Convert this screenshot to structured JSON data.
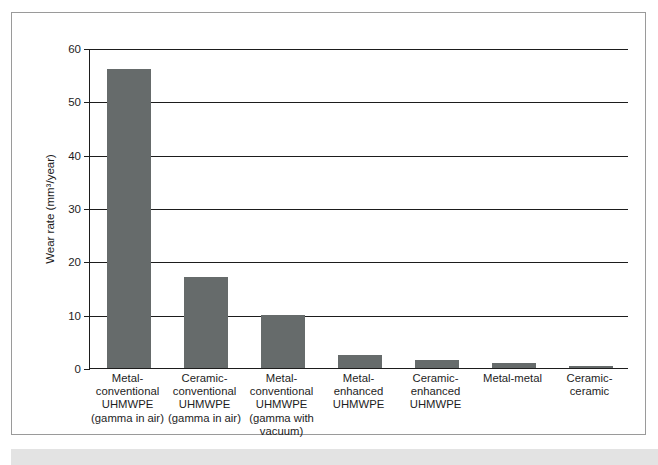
{
  "chart_data": {
    "type": "bar",
    "title": "",
    "xlabel": "",
    "ylabel": "Wear rate (mm³/year)",
    "ylim": [
      0,
      60
    ],
    "yticks": [
      0,
      10,
      20,
      30,
      40,
      50,
      60
    ],
    "ytick_labels": [
      "0",
      "10",
      "20",
      "30",
      "40",
      "50",
      "60"
    ],
    "grid": true,
    "legend": "none",
    "bar_color": "#666b6b",
    "categories": [
      "Metal-conventional UHMWPE (gamma in air)",
      "Ceramic-conventional UHMWPE (gamma in air)",
      "Metal-conventional UHMWPE (gamma with vacuum)",
      "Metal-enhanced UHMWPE",
      "Ceramic-enhanced UHMWPE",
      "Metal-metal",
      "Ceramic-ceramic"
    ],
    "category_lines": [
      [
        "Metal-",
        "conventional",
        "UHMWPE",
        "(gamma in air)"
      ],
      [
        "Ceramic-",
        "conventional",
        "UHMWPE",
        "(gamma in air)"
      ],
      [
        "Metal-",
        "conventional",
        "UHMWPE",
        "(gamma with",
        "vacuum)"
      ],
      [
        "Metal-enhanced",
        "UHMWPE"
      ],
      [
        "Ceramic-",
        "enhanced",
        "UHMWPE"
      ],
      [
        "Metal-metal"
      ],
      [
        "Ceramic-",
        "ceramic"
      ]
    ],
    "values": [
      56,
      17,
      10,
      2.4,
      1.5,
      1.0,
      0.4
    ]
  }
}
